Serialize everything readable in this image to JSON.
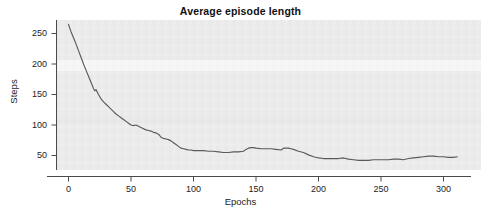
{
  "chart_data": {
    "type": "line",
    "title": "Average episode length",
    "xlabel": "Epochs",
    "ylabel": "Steps",
    "xlim": [
      -8,
      330
    ],
    "ylim": [
      22,
      278
    ],
    "xticks": [
      0,
      50,
      100,
      150,
      200,
      250,
      300
    ],
    "yticks": [
      50,
      100,
      150,
      200,
      250
    ],
    "grid": false,
    "legend": null,
    "line_color": "#5a5a5a",
    "panel_color": "#ebebeb",
    "series": [
      {
        "name": "average episode length",
        "x": [
          0,
          2,
          4,
          6,
          8,
          10,
          12,
          14,
          16,
          18,
          20,
          21,
          22,
          24,
          26,
          28,
          30,
          32,
          34,
          36,
          38,
          40,
          42,
          44,
          46,
          48,
          50,
          52,
          54,
          56,
          58,
          60,
          62,
          64,
          66,
          68,
          70,
          72,
          74,
          76,
          78,
          80,
          82,
          84,
          86,
          88,
          90,
          92,
          94,
          96,
          98,
          100,
          104,
          108,
          112,
          116,
          120,
          124,
          128,
          132,
          136,
          140,
          142,
          144,
          146,
          148,
          150,
          154,
          158,
          162,
          166,
          170,
          172,
          174,
          176,
          178,
          180,
          184,
          188,
          192,
          196,
          200,
          204,
          208,
          212,
          216,
          220,
          224,
          228,
          232,
          236,
          240,
          244,
          248,
          252,
          256,
          260,
          264,
          268,
          272,
          276,
          280,
          284,
          288,
          292,
          296,
          300,
          304,
          308,
          311
        ],
        "y": [
          265,
          253,
          243,
          233,
          222,
          211,
          200,
          190,
          180,
          170,
          160,
          156,
          158,
          150,
          143,
          138,
          134,
          130,
          126,
          122,
          118,
          115,
          112,
          109,
          106,
          103,
          100,
          99,
          100,
          98,
          96,
          94,
          92,
          91,
          90,
          88,
          87,
          85,
          80,
          78,
          77,
          76,
          74,
          71,
          68,
          65,
          62,
          61,
          60,
          59,
          59,
          58,
          58,
          58,
          57,
          57,
          56,
          55,
          55,
          56,
          56,
          57,
          60,
          62,
          63,
          63,
          62,
          61,
          61,
          61,
          60,
          59,
          62,
          62,
          62,
          61,
          60,
          57,
          55,
          51,
          48,
          46,
          45,
          45,
          45,
          45,
          46,
          44,
          43,
          42,
          42,
          42,
          43,
          43,
          43,
          43,
          44,
          44,
          43,
          45,
          46,
          47,
          48,
          49,
          49,
          48,
          48,
          47,
          47,
          48
        ]
      }
    ]
  },
  "axes": {
    "y_tick_labels": [
      "250",
      "200",
      "150",
      "100",
      "50"
    ],
    "x_tick_labels": [
      "0",
      "50",
      "100",
      "150",
      "200",
      "250",
      "300"
    ]
  }
}
